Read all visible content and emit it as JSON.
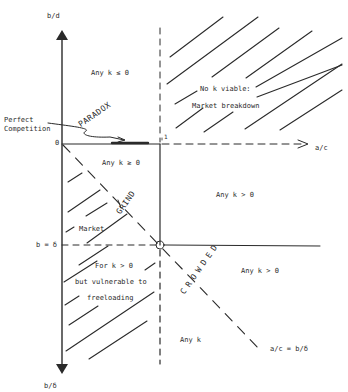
{
  "axes": {
    "y_top_label": "b/d",
    "y_bottom_label": "b/δ",
    "x_right_label": "a/c",
    "origin_label": "0",
    "x_tick_label": "1",
    "b_delta_label": "b = δ",
    "diagonal_label": "a/c = b/δ"
  },
  "regions": {
    "top_left": "Any k ≤ 0",
    "top_right_line1": "No k viable:",
    "top_right_line2": "Market breakdown",
    "middle_left": "Any k ≥ 0",
    "middle_right": "Any k > 0",
    "lower_right": "Any k > 0",
    "bottom_mid": "Any k",
    "market_label": "Market",
    "freeload_line1": "For k > 0",
    "freeload_line2": "but vulnerable to",
    "freeload_line3": "freeloading"
  },
  "annotations": {
    "perfect_line1": "Perfect",
    "perfect_line2": "Competition",
    "paradox": "PARADOX",
    "grind": "GRIND",
    "crowded": "CROWDED"
  },
  "colors": {
    "ink": "#2a2a2a",
    "background": "#ffffff"
  }
}
